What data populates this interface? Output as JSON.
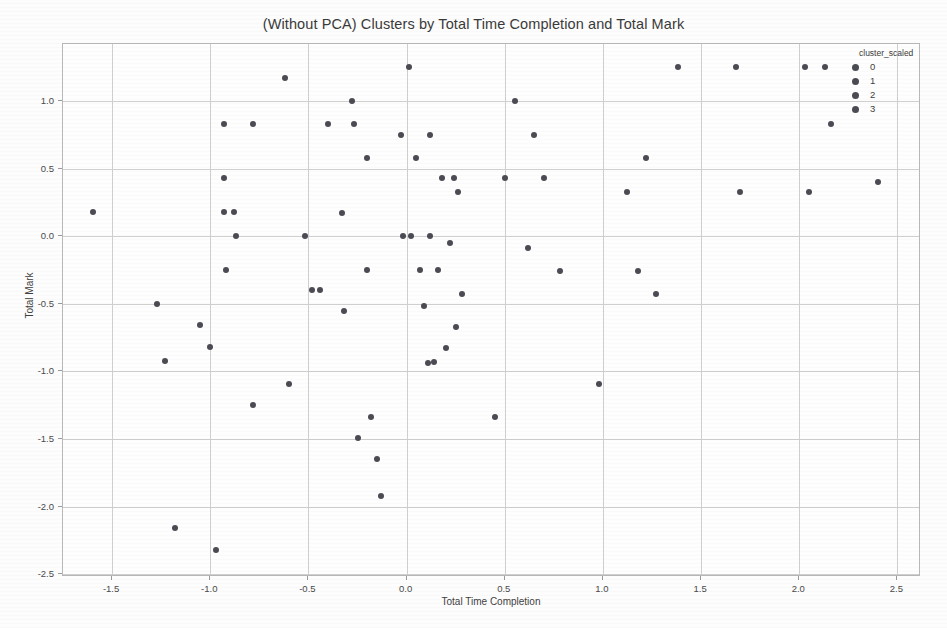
{
  "chart_data": {
    "type": "scatter",
    "title": "(Without PCA) Clusters by Total Time Completion and Total Mark",
    "xlabel": "Total Time Completion",
    "ylabel": "Total Mark",
    "xlim": [
      -1.75,
      2.62
    ],
    "ylim": [
      -2.52,
      1.42
    ],
    "xticks": [
      "-1.5",
      "-1.0",
      "-0.5",
      "0.0",
      "0.5",
      "1.0",
      "1.5",
      "2.0",
      "2.5"
    ],
    "xtick_values": [
      -1.5,
      -1.0,
      -0.5,
      0.0,
      0.5,
      1.0,
      1.5,
      2.0,
      2.5
    ],
    "yticks": [
      "1.0",
      "0.5",
      "0.0",
      "-0.5",
      "-1.0",
      "-1.5",
      "-2.0",
      "-2.5"
    ],
    "ytick_values": [
      1.0,
      0.5,
      0.0,
      -0.5,
      -1.0,
      -1.5,
      -2.0,
      -2.5
    ],
    "grid": true,
    "legend_position": "upper right",
    "marker_color": "#4b4b53",
    "legend": {
      "title": "cluster_scaled",
      "entries": [
        {
          "label": "0",
          "color": "#4b4b53"
        },
        {
          "label": "1",
          "color": "#4b4b53"
        },
        {
          "label": "2",
          "color": "#4b4b53"
        },
        {
          "label": "3",
          "color": "#4b4b53"
        }
      ]
    },
    "points": [
      [
        -1.6,
        0.18
      ],
      [
        -1.27,
        -0.5
      ],
      [
        -1.23,
        -0.92
      ],
      [
        -1.18,
        -2.16
      ],
      [
        -1.05,
        -0.66
      ],
      [
        -1.0,
        -0.82
      ],
      [
        -0.97,
        -2.32
      ],
      [
        -0.93,
        0.83
      ],
      [
        -0.93,
        0.43
      ],
      [
        -0.93,
        0.18
      ],
      [
        -0.92,
        -0.25
      ],
      [
        -0.88,
        0.18
      ],
      [
        -0.87,
        0.0
      ],
      [
        -0.78,
        0.83
      ],
      [
        -0.78,
        -1.25
      ],
      [
        -0.62,
        1.17
      ],
      [
        -0.6,
        -1.09
      ],
      [
        -0.52,
        0.0
      ],
      [
        -0.48,
        -0.4
      ],
      [
        -0.44,
        -0.4
      ],
      [
        -0.4,
        0.83
      ],
      [
        -0.33,
        0.17
      ],
      [
        -0.32,
        -0.55
      ],
      [
        -0.28,
        1.0
      ],
      [
        -0.27,
        0.83
      ],
      [
        -0.25,
        -1.49
      ],
      [
        -0.2,
        0.58
      ],
      [
        -0.2,
        -0.25
      ],
      [
        -0.18,
        -1.34
      ],
      [
        -0.15,
        -1.65
      ],
      [
        -0.13,
        -1.92
      ],
      [
        -0.03,
        0.75
      ],
      [
        -0.02,
        0.0
      ],
      [
        0.01,
        1.25
      ],
      [
        0.02,
        0.0
      ],
      [
        0.05,
        0.58
      ],
      [
        0.07,
        -0.25
      ],
      [
        0.09,
        -0.52
      ],
      [
        0.11,
        -0.94
      ],
      [
        0.12,
        0.75
      ],
      [
        0.12,
        0.0
      ],
      [
        0.14,
        -0.93
      ],
      [
        0.16,
        -0.25
      ],
      [
        0.18,
        0.43
      ],
      [
        0.2,
        -0.83
      ],
      [
        0.22,
        -0.05
      ],
      [
        0.24,
        0.43
      ],
      [
        0.25,
        -0.67
      ],
      [
        0.26,
        0.33
      ],
      [
        0.28,
        -0.43
      ],
      [
        0.45,
        -1.34
      ],
      [
        0.5,
        0.43
      ],
      [
        0.55,
        1.0
      ],
      [
        0.62,
        -0.09
      ],
      [
        0.65,
        0.75
      ],
      [
        0.7,
        0.43
      ],
      [
        0.78,
        -0.26
      ],
      [
        0.98,
        -1.09
      ],
      [
        1.12,
        0.33
      ],
      [
        1.18,
        -0.26
      ],
      [
        1.22,
        0.58
      ],
      [
        1.27,
        -0.43
      ],
      [
        1.38,
        1.25
      ],
      [
        1.68,
        1.25
      ],
      [
        1.7,
        0.33
      ],
      [
        2.03,
        1.25
      ],
      [
        2.05,
        0.33
      ],
      [
        2.13,
        1.25
      ],
      [
        2.16,
        0.83
      ],
      [
        2.4,
        0.4
      ]
    ]
  }
}
